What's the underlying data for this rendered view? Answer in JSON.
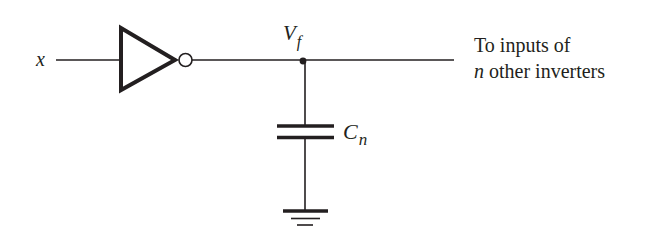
{
  "diagram": {
    "input_label": "x",
    "node_label": {
      "main": "V",
      "sub": "f"
    },
    "capacitor_label": {
      "main": "C",
      "sub": "n"
    },
    "output_text": {
      "line1": "To inputs of",
      "line2_var": "n",
      "line2_rest": " other inverters"
    },
    "components": [
      "inverter",
      "junction-node",
      "capacitor",
      "ground"
    ],
    "colors": {
      "stroke": "#231f20",
      "background": "#ffffff"
    }
  }
}
